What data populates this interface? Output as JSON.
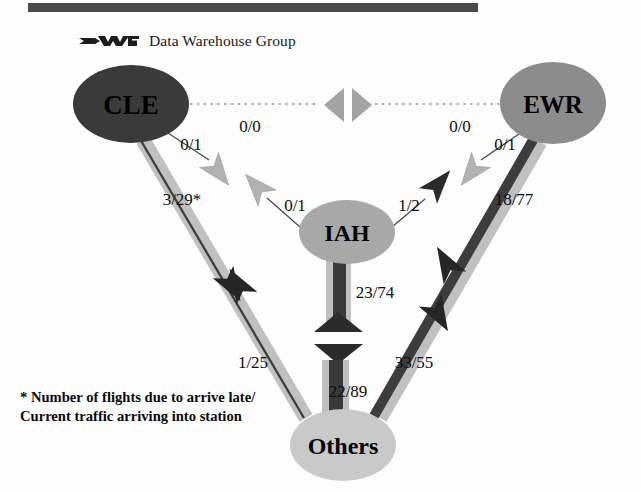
{
  "header": {
    "rule_color": "#4a4a4a",
    "logo_icon": "dwg-logo-icon",
    "brand_text": "Data Warehouse Group"
  },
  "footnote": {
    "line1": "* Number of flights due to arrive late/",
    "line2": "Current traffic arriving into station"
  },
  "palette": {
    "cle_fill": "#3a3a3a",
    "ewr_fill": "#8c8c8c",
    "iah_fill": "#a8a8a8",
    "others_fill": "#c9c9c9",
    "band_light": "#bdbdbd",
    "band_dark": "#3d3d3d",
    "arrow_light": "#a9a9a9",
    "arrow_dark": "#2b2b2b",
    "dotted": "#9a9a9a",
    "text": "#0d0d0d"
  },
  "nodes": [
    {
      "id": "CLE",
      "label": "CLE",
      "cx": 131,
      "cy": 104,
      "rx": 58,
      "ry": 39,
      "fill": "#3a3a3a",
      "text_color": "#000000",
      "font_size": 27
    },
    {
      "id": "EWR",
      "label": "EWR",
      "cx": 553,
      "cy": 103,
      "rx": 53,
      "ry": 41,
      "fill": "#8c8c8c",
      "text_color": "#000000",
      "font_size": 25
    },
    {
      "id": "IAH",
      "label": "IAH",
      "cx": 347,
      "cy": 232,
      "rx": 48,
      "ry": 32,
      "fill": "#a8a8a8",
      "text_color": "#000000",
      "font_size": 24
    },
    {
      "id": "Others",
      "label": "Others",
      "cx": 343,
      "cy": 445,
      "rx": 53,
      "ry": 36,
      "fill": "#c9c9c9",
      "text_color": "#000000",
      "font_size": 24
    }
  ],
  "edges": [
    {
      "id": "cle-ewr",
      "from": "CLE",
      "to": "EWR",
      "style": "dotted",
      "label_out": "0/0",
      "label_in": "0/0"
    },
    {
      "id": "cle-iah",
      "from": "CLE",
      "to": "IAH",
      "style": "thin",
      "label_out": "0/1",
      "label_in": "0/1"
    },
    {
      "id": "ewr-iah",
      "from": "EWR",
      "to": "IAH",
      "style": "thin",
      "label_out": "0/1",
      "label_in": "1/2"
    },
    {
      "id": "cle-others",
      "from": "CLE",
      "to": "Others",
      "style": "band",
      "label_out": "3/29*",
      "label_in": "1/25"
    },
    {
      "id": "ewr-others",
      "from": "EWR",
      "to": "Others",
      "style": "band",
      "label_out": "18/77",
      "label_in": "33/55"
    },
    {
      "id": "iah-others",
      "from": "IAH",
      "to": "Others",
      "style": "band-vert",
      "label_out": "23/74",
      "label_in": "22/89"
    }
  ],
  "labels": {
    "cle_ewr_left": {
      "text": "0/0",
      "x": 250,
      "y": 126
    },
    "cle_ewr_right": {
      "text": "0/0",
      "x": 460,
      "y": 126
    },
    "cle_iah_near": {
      "text": "0/1",
      "x": 191,
      "y": 144
    },
    "cle_iah_far": {
      "text": "0/1",
      "x": 295,
      "y": 205
    },
    "ewr_iah_near": {
      "text": "0/1",
      "x": 505,
      "y": 144
    },
    "ewr_iah_far": {
      "text": "1/2",
      "x": 409,
      "y": 205
    },
    "cle_others_up": {
      "text": "3/29*",
      "x": 182,
      "y": 199
    },
    "cle_others_dn": {
      "text": "1/25",
      "x": 253,
      "y": 362
    },
    "ewr_others_up": {
      "text": "18/77",
      "x": 514,
      "y": 199
    },
    "ewr_others_dn": {
      "text": "33/55",
      "x": 414,
      "y": 362
    },
    "iah_others_up": {
      "text": "23/74",
      "x": 375,
      "y": 292
    },
    "iah_others_dn": {
      "text": "22/89",
      "x": 348,
      "y": 391
    }
  }
}
